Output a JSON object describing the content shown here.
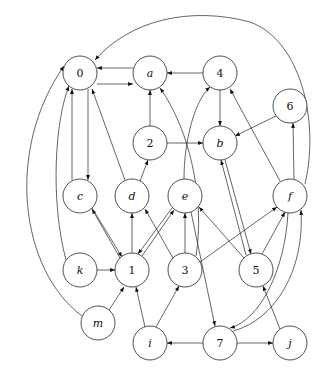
{
  "graph": {
    "type": "directed",
    "nodes": [
      {
        "id": "0",
        "label": "0",
        "italic": false,
        "x": 80,
        "y": 73
      },
      {
        "id": "a",
        "label": "a",
        "italic": true,
        "x": 150,
        "y": 73
      },
      {
        "id": "4",
        "label": "4",
        "italic": false,
        "x": 220,
        "y": 73
      },
      {
        "id": "6",
        "label": "6",
        "italic": false,
        "x": 290,
        "y": 106
      },
      {
        "id": "2",
        "label": "2",
        "italic": false,
        "x": 150,
        "y": 143
      },
      {
        "id": "b",
        "label": "b",
        "italic": true,
        "x": 220,
        "y": 143
      },
      {
        "id": "c",
        "label": "c",
        "italic": true,
        "x": 80,
        "y": 196
      },
      {
        "id": "d",
        "label": "d",
        "italic": true,
        "x": 132,
        "y": 196
      },
      {
        "id": "e",
        "label": "e",
        "italic": true,
        "x": 185,
        "y": 196
      },
      {
        "id": "f",
        "label": "f",
        "italic": true,
        "x": 290,
        "y": 196
      },
      {
        "id": "k",
        "label": "k",
        "italic": true,
        "x": 80,
        "y": 270
      },
      {
        "id": "1",
        "label": "1",
        "italic": false,
        "x": 132,
        "y": 270
      },
      {
        "id": "3",
        "label": "3",
        "italic": false,
        "x": 185,
        "y": 270
      },
      {
        "id": "5",
        "label": "5",
        "italic": false,
        "x": 256,
        "y": 270
      },
      {
        "id": "m",
        "label": "m",
        "italic": true,
        "x": 98,
        "y": 323
      },
      {
        "id": "i",
        "label": "i",
        "italic": true,
        "x": 150,
        "y": 343
      },
      {
        "id": "7",
        "label": "7",
        "italic": false,
        "x": 220,
        "y": 343
      },
      {
        "id": "j",
        "label": "j",
        "italic": true,
        "x": 290,
        "y": 343
      }
    ],
    "edges": [
      {
        "from": "a",
        "to": "0"
      },
      {
        "from": "0",
        "to": "a"
      },
      {
        "from": "4",
        "to": "a"
      },
      {
        "from": "2",
        "to": "a"
      },
      {
        "from": "4",
        "to": "b"
      },
      {
        "from": "6",
        "to": "b"
      },
      {
        "from": "2",
        "to": "b"
      },
      {
        "from": "0",
        "to": "c"
      },
      {
        "from": "c",
        "to": "0"
      },
      {
        "from": "d",
        "to": "0"
      },
      {
        "from": "d",
        "to": "2"
      },
      {
        "from": "f",
        "to": "0"
      },
      {
        "from": "f",
        "to": "4"
      },
      {
        "from": "f",
        "to": "6"
      },
      {
        "from": "e",
        "to": "4"
      },
      {
        "from": "1",
        "to": "c"
      },
      {
        "from": "c",
        "to": "1"
      },
      {
        "from": "1",
        "to": "d"
      },
      {
        "from": "1",
        "to": "e"
      },
      {
        "from": "e",
        "to": "1"
      },
      {
        "from": "3",
        "to": "d"
      },
      {
        "from": "3",
        "to": "e"
      },
      {
        "from": "5",
        "to": "e"
      },
      {
        "from": "3",
        "to": "f"
      },
      {
        "from": "3",
        "to": "a"
      },
      {
        "from": "b",
        "to": "5"
      },
      {
        "from": "5",
        "to": "b"
      },
      {
        "from": "5",
        "to": "f"
      },
      {
        "from": "f",
        "to": "7"
      },
      {
        "from": "7",
        "to": "f"
      },
      {
        "from": "k",
        "to": "1"
      },
      {
        "from": "k",
        "to": "0"
      },
      {
        "from": "m",
        "to": "1"
      },
      {
        "from": "m",
        "to": "0"
      },
      {
        "from": "i",
        "to": "1"
      },
      {
        "from": "i",
        "to": "3"
      },
      {
        "from": "7",
        "to": "i"
      },
      {
        "from": "7",
        "to": "j"
      },
      {
        "from": "j",
        "to": "5"
      },
      {
        "from": "e",
        "to": "7"
      }
    ]
  }
}
